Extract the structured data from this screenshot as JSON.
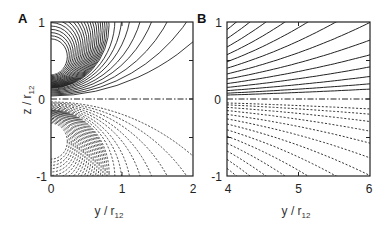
{
  "chart_data": [
    {
      "type": "line",
      "panel": "A",
      "title": "",
      "xlabel": "y / r12",
      "ylabel": "z / r12",
      "xlim": [
        0,
        2
      ],
      "ylim": [
        -1,
        1
      ],
      "xticks": [
        "0",
        "1",
        "2"
      ],
      "yticks": [
        "-1",
        "0",
        "1"
      ],
      "grid": false,
      "description": "Contour lines: solid curves concentric around source at (0, 0.5) for z>0; dotted curves concentric around (0, -0.5) for z<0; dash-dot line at z=0",
      "series": [
        {
          "name": "positive contours",
          "style": "solid",
          "center": [
            0,
            0.5
          ]
        },
        {
          "name": "negative contours",
          "style": "dotted",
          "center": [
            0,
            -0.5
          ]
        },
        {
          "name": "symmetry line",
          "style": "dash-dot",
          "z": 0
        }
      ]
    },
    {
      "type": "line",
      "panel": "B",
      "title": "",
      "xlabel": "y / r12",
      "ylabel": "",
      "xlim": [
        4,
        6
      ],
      "ylim": [
        -1,
        1
      ],
      "xticks": [
        "4",
        "5",
        "6"
      ],
      "yticks": [
        "-1",
        "0",
        "1"
      ],
      "grid": false,
      "description": "Far-field contour lines: solid curves above z=0 fanning outward, dotted curves below z=0 mirrored; dash-dot line at z=0",
      "series": [
        {
          "name": "positive contours",
          "style": "solid"
        },
        {
          "name": "negative contours",
          "style": "dotted"
        },
        {
          "name": "symmetry line",
          "style": "dash-dot",
          "z": 0
        }
      ]
    }
  ],
  "panels": {
    "a": {
      "label": "A",
      "xticks": [
        "0",
        "1",
        "2"
      ],
      "yticks": [
        "1",
        "0",
        "-1"
      ],
      "xlabel_main": "y / r",
      "xlabel_sub": "12",
      "ylabel_main": "z / r",
      "ylabel_sub": "12"
    },
    "b": {
      "label": "B",
      "xticks": [
        "4",
        "5",
        "6"
      ],
      "yticks": [
        "1",
        "0",
        "-1"
      ],
      "xlabel_main": "y / r",
      "xlabel_sub": "12"
    }
  }
}
